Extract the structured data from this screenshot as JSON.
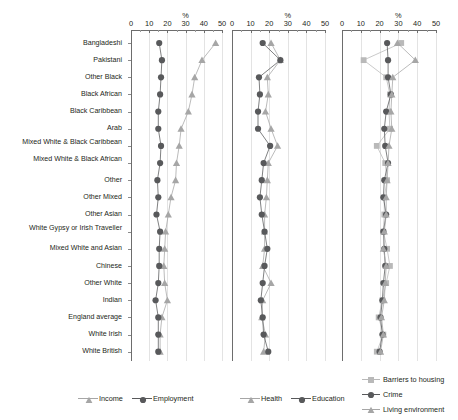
{
  "chart_data": {
    "type": "line",
    "title": "",
    "xlabel": "%",
    "ylabel": "",
    "xlim": [
      0,
      50
    ],
    "xticks": [
      0,
      10,
      20,
      30,
      40,
      50
    ],
    "grid": true,
    "orientation": "horizontal-categories",
    "axis_unit_label": "%",
    "categories": [
      "Bangladeshi",
      "Pakistani",
      "Other Black",
      "Black African",
      "Black Caribbean",
      "Arab",
      "Mixed White & Black Caribbean",
      "Mixed White & Black African",
      "Other",
      "Other Mixed",
      "Other Asian",
      "White Gypsy or Irish Traveller",
      "Mixed White and Asian",
      "Chinese",
      "Other White",
      "Indian",
      "England average",
      "White Irish",
      "White British"
    ],
    "panels": [
      {
        "name": "panel-income-employment",
        "legend_position": "bottom",
        "series": [
          {
            "name": "Income",
            "marker": "triangle",
            "color": "#a6a6a6",
            "values": [
              46.5,
              39.0,
              35.0,
              33.5,
              31.5,
              27.5,
              26.5,
              25.0,
              24.5,
              22.0,
              20.5,
              19.0,
              18.5,
              18.0,
              18.5,
              20.0,
              17.0,
              16.0,
              16.0
            ]
          },
          {
            "name": "Employment",
            "marker": "circle",
            "color": "#58595b",
            "values": [
              15.5,
              17.0,
              16.5,
              16.0,
              15.0,
              15.0,
              16.5,
              16.0,
              14.5,
              15.0,
              14.0,
              16.0,
              15.5,
              15.5,
              15.0,
              13.5,
              15.0,
              15.0,
              15.0
            ]
          }
        ]
      },
      {
        "name": "panel-health-education",
        "legend_position": "bottom",
        "series": [
          {
            "name": "Health",
            "marker": "triangle",
            "color": "#a6a6a6",
            "values": [
              21.0,
              26.0,
              19.0,
              19.5,
              18.0,
              21.0,
              24.5,
              19.5,
              19.0,
              18.5,
              17.5,
              17.5,
              17.5,
              16.5,
              21.0,
              16.5,
              16.0,
              18.0,
              17.0
            ]
          },
          {
            "name": "Education",
            "marker": "circle",
            "color": "#58595b",
            "values": [
              16.5,
              26.0,
              14.5,
              15.0,
              14.0,
              14.0,
              20.5,
              17.0,
              16.0,
              15.0,
              16.0,
              17.5,
              19.0,
              17.5,
              16.5,
              15.5,
              16.5,
              17.0,
              19.5
            ]
          }
        ]
      },
      {
        "name": "panel-barriers-crime-living",
        "legend_position": "bottom-right",
        "series": [
          {
            "name": "Barriers to housing",
            "marker": "square",
            "color": "#b9b9b9",
            "values": [
              31.5,
              11.5,
              23.5,
              25.5,
              25.0,
              25.5,
              18.5,
              23.0,
              24.0,
              22.5,
              22.5,
              22.0,
              24.0,
              25.5,
              23.5,
              21.5,
              19.5,
              22.0,
              18.5
            ]
          },
          {
            "name": "Crime",
            "marker": "circle",
            "color": "#58595b",
            "values": [
              24.0,
              24.5,
              24.5,
              26.0,
              23.5,
              22.5,
              23.0,
              24.5,
              22.5,
              22.0,
              23.5,
              22.0,
              22.5,
              23.0,
              22.0,
              21.5,
              20.5,
              21.5,
              20.0
            ]
          },
          {
            "name": "Living environment",
            "marker": "triangle",
            "color": "#a6a6a6",
            "values": [
              29.5,
              39.0,
              27.0,
              26.5,
              26.0,
              26.5,
              25.0,
              24.5,
              24.0,
              23.5,
              23.5,
              22.5,
              22.0,
              23.5,
              23.0,
              22.5,
              21.0,
              22.0,
              20.5
            ]
          }
        ]
      }
    ]
  },
  "legends": {
    "panel1": [
      "Income",
      "Employment"
    ],
    "panel2": [
      "Health",
      "Education"
    ],
    "panel3": [
      "Barriers to housing",
      "Crime",
      "Living environment"
    ]
  },
  "colors": {
    "light_grey": "#a6a6a6",
    "dark_grey": "#58595b",
    "square_grey": "#b9b9b9",
    "gridline": "#e3e3e3",
    "axis": "#6d6d6d",
    "text": "#231f20"
  }
}
